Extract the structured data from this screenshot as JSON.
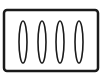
{
  "icon": {
    "name": "four-ellipses-in-frame-icon",
    "stroke_color": "#1a1a1a",
    "fill_color": "#ffffff",
    "frame": {
      "x": 4,
      "y": 10,
      "width": 94,
      "height": 61,
      "radius": 3
    },
    "ellipses": [
      {
        "cx": 23,
        "cy": 42,
        "rx": 4,
        "ry": 21
      },
      {
        "cx": 42,
        "cy": 42,
        "rx": 4,
        "ry": 21
      },
      {
        "cx": 60,
        "cy": 42,
        "rx": 4,
        "ry": 21
      },
      {
        "cx": 79,
        "cy": 42,
        "rx": 4,
        "ry": 21
      }
    ]
  }
}
